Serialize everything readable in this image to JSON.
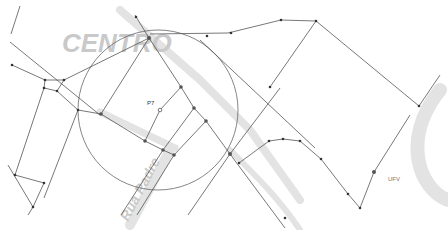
{
  "map": {
    "background_labels": {
      "district": "CENTRO",
      "street": "Rua Padre"
    },
    "labels": {
      "point": "P7",
      "campus": "UFV"
    },
    "circle": {
      "cx": 158,
      "cy": 110,
      "r": 80
    },
    "colors": {
      "edge": "#555555",
      "node": "#333333",
      "ghost_text": "#c9c9c9",
      "background": "#ffffff"
    }
  }
}
